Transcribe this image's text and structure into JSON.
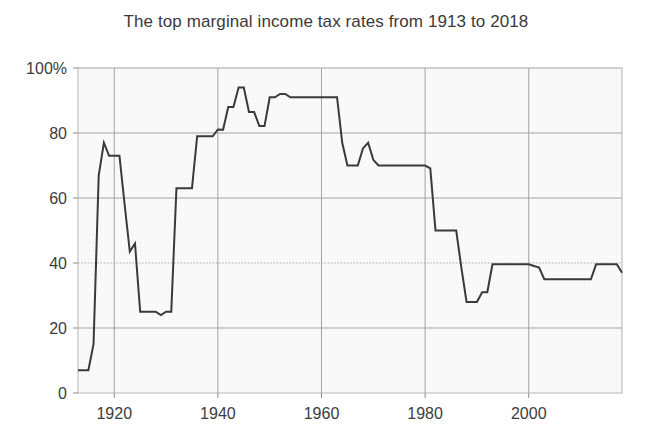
{
  "chart_data": {
    "type": "line",
    "title": "The top marginal income tax rates from 1913 to 2018",
    "xlabel": "",
    "ylabel": "",
    "xlim": [
      1913,
      2018
    ],
    "ylim": [
      0,
      100
    ],
    "xticks": [
      1920,
      1940,
      1960,
      1980,
      2000
    ],
    "xtick_labels": [
      "1920",
      "1940",
      "1960",
      "1980",
      "2000"
    ],
    "yticks": [
      0,
      20,
      40,
      60,
      80,
      100
    ],
    "ytick_labels": [
      "0",
      "20",
      "40",
      "60",
      "80",
      "100%"
    ],
    "grid": true,
    "legend": null,
    "series": [
      {
        "name": "Top marginal income tax rate",
        "color": "#3a3a3a",
        "x": [
          1913,
          1914,
          1915,
          1916,
          1917,
          1918,
          1919,
          1920,
          1921,
          1922,
          1923,
          1924,
          1925,
          1926,
          1927,
          1928,
          1929,
          1930,
          1931,
          1932,
          1933,
          1934,
          1935,
          1936,
          1937,
          1938,
          1939,
          1940,
          1941,
          1942,
          1943,
          1944,
          1945,
          1946,
          1947,
          1948,
          1949,
          1950,
          1951,
          1952,
          1953,
          1954,
          1955,
          1956,
          1957,
          1958,
          1959,
          1960,
          1961,
          1962,
          1963,
          1964,
          1965,
          1966,
          1967,
          1968,
          1969,
          1970,
          1971,
          1972,
          1973,
          1974,
          1975,
          1976,
          1977,
          1978,
          1979,
          1980,
          1981,
          1982,
          1983,
          1984,
          1985,
          1986,
          1987,
          1988,
          1989,
          1990,
          1991,
          1992,
          1993,
          1994,
          1995,
          1996,
          1997,
          1998,
          1999,
          2000,
          2001,
          2002,
          2003,
          2004,
          2005,
          2006,
          2007,
          2008,
          2009,
          2010,
          2011,
          2012,
          2013,
          2014,
          2015,
          2016,
          2017,
          2018
        ],
        "y": [
          7,
          7,
          7,
          15,
          67,
          77,
          73,
          73,
          73,
          58,
          43.5,
          46,
          25,
          25,
          25,
          25,
          24,
          25,
          25,
          63,
          63,
          63,
          63,
          79,
          79,
          79,
          79,
          81.1,
          81,
          88,
          88,
          94,
          94,
          86.45,
          86.45,
          82.13,
          82.13,
          91,
          91,
          92,
          92,
          91,
          91,
          91,
          91,
          91,
          91,
          91,
          91,
          91,
          91,
          77,
          70,
          70,
          70,
          75.25,
          77,
          71.75,
          70,
          70,
          70,
          70,
          70,
          70,
          70,
          70,
          70,
          70,
          69.125,
          50,
          50,
          50,
          50,
          50,
          38.5,
          28,
          28,
          28,
          31,
          31,
          39.6,
          39.6,
          39.6,
          39.6,
          39.6,
          39.6,
          39.6,
          39.6,
          39.1,
          38.6,
          35,
          35,
          35,
          35,
          35,
          35,
          35,
          35,
          35,
          35,
          39.6,
          39.6,
          39.6,
          39.6,
          39.6,
          37
        ],
        "annotations": [
          {
            "label": "WWI peak",
            "year": 1918,
            "value": 77
          },
          {
            "label": "WWII peak",
            "year": 1944,
            "value": 94
          },
          {
            "label": "post-war plateau",
            "year": 1955,
            "value": 91
          },
          {
            "label": "Reagan low",
            "year": 1988,
            "value": 28
          },
          {
            "label": "current",
            "year": 2018,
            "value": 37
          }
        ]
      }
    ]
  },
  "axes": {
    "y_tick_0": "0",
    "y_tick_20": "20",
    "y_tick_40": "40",
    "y_tick_60": "60",
    "y_tick_80": "80",
    "y_tick_100": "100%",
    "x_tick_1920": "1920",
    "x_tick_1940": "1940",
    "x_tick_1960": "1960",
    "x_tick_1980": "1980",
    "x_tick_2000": "2000"
  },
  "style": {
    "line_color": "#3a3a3a",
    "grid_color": "#9a9a9a",
    "frame_color": "#b5b5b5",
    "text_color": "#3c3c3c",
    "background": "#ffffff",
    "plot_background": "#fbfbfb"
  }
}
